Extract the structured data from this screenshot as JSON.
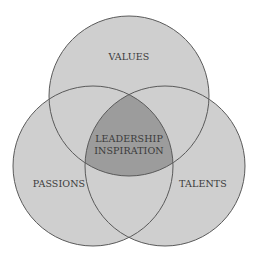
{
  "diagram": {
    "type": "venn",
    "circles": [
      {
        "label": "VALUES",
        "cx": 129,
        "cy": 96,
        "r": 80
      },
      {
        "label": "PASSIONS",
        "cx": 93,
        "cy": 166,
        "r": 80
      },
      {
        "label": "TALENTS",
        "cx": 165,
        "cy": 166,
        "r": 80
      }
    ],
    "intersection": {
      "line1": "LEADERSHIP",
      "line2": "INSPIRATION"
    },
    "colors": {
      "fill": "#cfcfcf",
      "center_fill": "#9c9c9c",
      "stroke": "#5a5a5a",
      "text": "#3a3a3a"
    }
  }
}
